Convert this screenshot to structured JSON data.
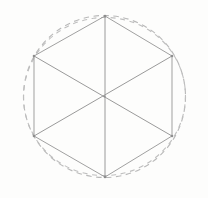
{
  "figure": {
    "background_color": "#fdfdfc",
    "canvas": {
      "width": 208,
      "height": 198
    },
    "solid_line_color": "#9a9a9a",
    "dashed_line_color": "#b9b9b9"
  },
  "chart_data": {
    "type": "scatter",
    "xlabel": "",
    "ylabel": "",
    "xlim": [
      0,
      208
    ],
    "ylim": [
      0,
      198
    ],
    "grid": false,
    "legend": "none",
    "center": {
      "label": "center",
      "x": 104.5,
      "y": 96.5
    },
    "circumradius": 81,
    "vertex_count": 6,
    "vertices": [
      {
        "label": "top",
        "x": 105,
        "y": 16
      },
      {
        "label": "top-right",
        "x": 172,
        "y": 56
      },
      {
        "label": "bottom-right",
        "x": 172,
        "y": 136
      },
      {
        "label": "bottom",
        "x": 105,
        "y": 177
      },
      {
        "label": "bottom-left",
        "x": 34,
        "y": 136
      },
      {
        "label": "top-left",
        "x": 34,
        "y": 56
      }
    ],
    "edges": [
      {
        "label": "edge-top-right",
        "from": "top",
        "to": "top-right"
      },
      {
        "label": "edge-right",
        "from": "top-right",
        "to": "bottom-right"
      },
      {
        "label": "edge-bottom-right",
        "from": "bottom-right",
        "to": "bottom"
      },
      {
        "label": "edge-bottom-left",
        "from": "bottom",
        "to": "bottom-left"
      },
      {
        "label": "edge-left",
        "from": "bottom-left",
        "to": "top-left"
      },
      {
        "label": "edge-top-left",
        "from": "top-left",
        "to": "top"
      }
    ],
    "diagonals": [
      {
        "label": "diagonal-vertical",
        "from": "top",
        "to": "bottom"
      },
      {
        "label": "diagonal-upper-left-to-lower-right",
        "from": "top-left",
        "to": "bottom-right"
      },
      {
        "label": "diagonal-upper-right-to-lower-left",
        "from": "top-right",
        "to": "bottom-left"
      }
    ],
    "circles": [
      {
        "label": "circumscribed-circle-primary",
        "style": "dashed",
        "cx": 104.5,
        "cy": 96.5,
        "rx": 81,
        "ry": 81,
        "rotation": 0
      },
      {
        "label": "circumscribed-circle-secondary",
        "style": "dashed",
        "cx": 104.5,
        "cy": 96.5,
        "rx": 81,
        "ry": 79,
        "rotation": -8
      }
    ],
    "annotations": []
  }
}
